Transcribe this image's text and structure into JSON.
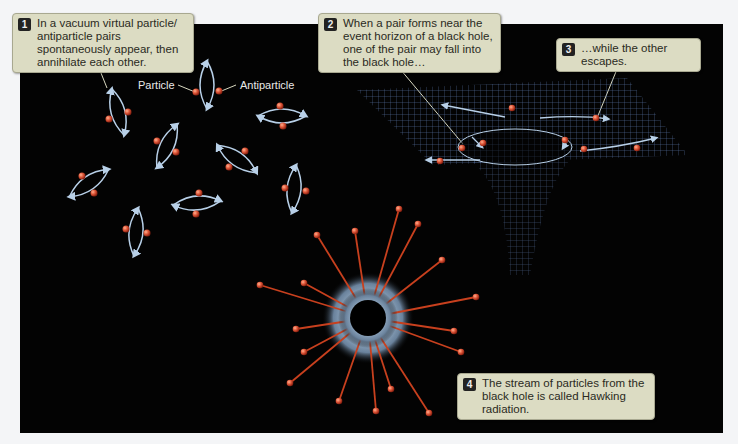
{
  "callouts": [
    {
      "number": "1",
      "text": "In a vacuum virtual particle/ antiparticle pairs spontaneously appear, then annihilate each other."
    },
    {
      "number": "2",
      "text": "When a pair forms near the event horizon of a black hole, one of the pair may fall into the black hole…"
    },
    {
      "number": "3",
      "text": "…while the other escapes."
    },
    {
      "number": "4",
      "text": "The stream of particles from the black hole is called Hawking radiation."
    }
  ],
  "labels": {
    "particle": "Particle",
    "antiparticle": "Antiparticle"
  },
  "colors": {
    "background": "#030303",
    "callout": "#dcdcc3",
    "particle": "#e0603a",
    "arrow": "#b8d0e8",
    "grid": "#6d8fc0"
  }
}
